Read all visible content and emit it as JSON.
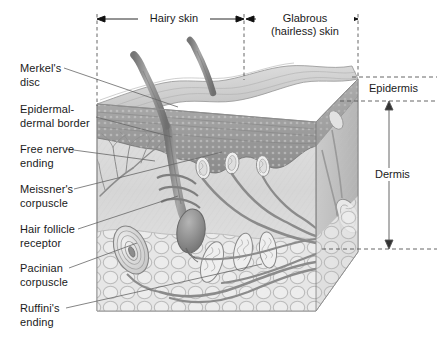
{
  "figure": {
    "background_color": "#ffffff",
    "line_color": "#555555",
    "text_color": "#1a1a1a"
  },
  "top_brackets": [
    {
      "label": "Hairy skin",
      "x_start": 97,
      "x_end": 244,
      "y": 19
    },
    {
      "label": "Glabrous\n(hairless) skin",
      "x_start": 246,
      "x_end": 358,
      "y": 19
    }
  ],
  "layer_labels": [
    {
      "label": "Epidermis",
      "y_top": 77,
      "y_bottom": 101,
      "has_arrow": false
    },
    {
      "label": "Dermis",
      "y_top": 101,
      "y_bottom": 249,
      "has_arrow": true
    }
  ],
  "receptor_labels": [
    {
      "label": "Merkel's\ndisc",
      "x": 20,
      "y": 62,
      "leader_to_x": 178,
      "leader_to_y": 107
    },
    {
      "label": "Epidermal-\ndermal border",
      "x": 20,
      "y": 103,
      "leader_to_x": 172,
      "leader_to_y": 137
    },
    {
      "label": "Free nerve\nending",
      "x": 20,
      "y": 143,
      "leader_to_x": 155,
      "leader_to_y": 161
    },
    {
      "label": "Meissner's\ncorpuscle",
      "x": 20,
      "y": 183,
      "leader_to_x": 222,
      "leader_to_y": 152
    },
    {
      "label": "Hair follicle\nreceptor",
      "x": 20,
      "y": 223,
      "leader_to_x": 178,
      "leader_to_y": 196
    },
    {
      "label": "Pacinian\ncorpuscle",
      "x": 20,
      "y": 262,
      "leader_to_x": 137,
      "leader_to_y": 243
    },
    {
      "label": "Ruffini's\nending",
      "x": 20,
      "y": 302,
      "leader_to_x": 262,
      "leader_to_y": 264
    }
  ],
  "illustration": {
    "type": "anatomical-3d-block",
    "subject": "skin",
    "palette": {
      "epidermis_surface": "#c9c9c9",
      "epidermis_band": "#9a9a9a",
      "dermis": "#d2d2d2",
      "subcutaneous": "#dcdcdc",
      "nerve": "#8d8d8d",
      "hair_shaft": "#8f8f8f",
      "outline": "#7a7a7a"
    },
    "features": [
      "two hair shafts emerging from hairy-skin side",
      "undulating epidermal surface with rete ridges",
      "stratified epidermal band",
      "branching free nerve endings in papillary dermis",
      "Meissner's corpuscles in dermal papillae of glabrous skin",
      "hair follicle with bulb and encircling nerve fibers",
      "onion-layered Pacinian corpuscle in deep dermis",
      "spindle-shaped Ruffini endings in deep dermis",
      "nerve bundles exiting at the cut right face"
    ]
  }
}
